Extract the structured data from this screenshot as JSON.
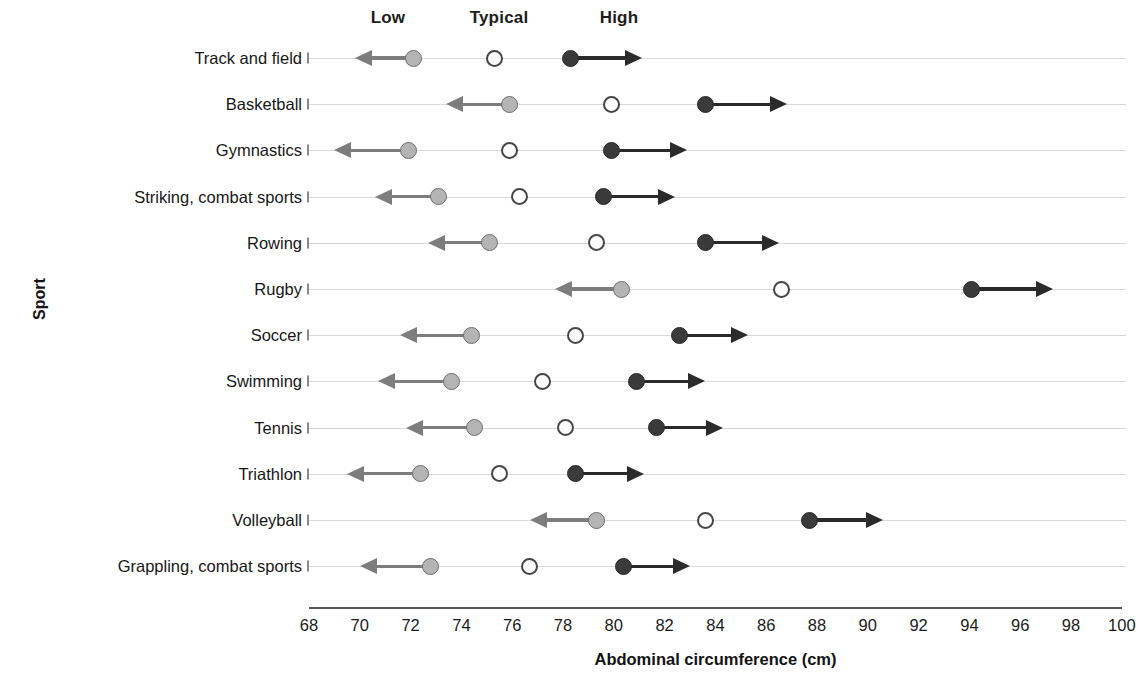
{
  "chart_data": {
    "type": "scatter",
    "title": "",
    "xlabel": "Abdominal circumference (cm)",
    "ylabel": "Sport",
    "xlim": [
      68,
      100
    ],
    "xticks": [
      68,
      70,
      72,
      74,
      76,
      78,
      80,
      82,
      84,
      86,
      88,
      90,
      92,
      94,
      96,
      98,
      100
    ],
    "grid": true,
    "legend_position": "top",
    "series_headers": [
      "Low",
      "Typical",
      "High"
    ],
    "series_note": "Low markers carry a left-pointing arrow; High markers carry a right-pointing arrow; Typical is an open circle.",
    "categories": [
      "Track and field",
      "Basketball",
      "Gymnastics",
      "Striking, combat sports",
      "Rowing",
      "Rugby",
      "Soccer",
      "Swimming",
      "Tennis",
      "Triathlon",
      "Volleyball",
      "Grappling, combat sports"
    ],
    "series": [
      {
        "name": "Low",
        "values": [
          72.1,
          75.9,
          71.9,
          73.1,
          75.1,
          80.3,
          74.4,
          73.6,
          74.5,
          72.4,
          79.3,
          72.8
        ],
        "arrow_tips": [
          69.8,
          73.4,
          69.0,
          70.6,
          72.7,
          77.7,
          71.6,
          70.7,
          71.8,
          69.5,
          76.7,
          70.0
        ],
        "arrow_direction": "left"
      },
      {
        "name": "Typical",
        "values": [
          75.3,
          79.9,
          75.9,
          76.3,
          79.3,
          86.6,
          78.5,
          77.2,
          78.1,
          75.5,
          83.6,
          76.7
        ],
        "arrow_direction": "none"
      },
      {
        "name": "High",
        "values": [
          78.3,
          83.6,
          79.9,
          79.6,
          83.6,
          94.1,
          82.6,
          80.9,
          81.7,
          78.5,
          87.7,
          80.4
        ],
        "arrow_tips": [
          81.1,
          86.8,
          82.9,
          82.4,
          86.5,
          97.3,
          85.3,
          83.6,
          84.3,
          81.2,
          90.6,
          83.0
        ],
        "arrow_direction": "right"
      }
    ],
    "colors": {
      "low": "#b4b4b4",
      "low_outline": "#6e6e6e",
      "typical_fill": "#ffffff",
      "typical_outline": "#464646",
      "high": "#3a3a3a",
      "gridline": "#d9d9d9",
      "axis": "#575757",
      "text": "#1b1b1b"
    }
  },
  "headers": {
    "low": "Low",
    "typical": "Typical",
    "high": "High",
    "low_x": 80.0,
    "typical_x": 85.5,
    "high_x": 91.0
  },
  "axes": {
    "x_title": "Abdominal circumference (cm)",
    "y_title": "Sport"
  }
}
